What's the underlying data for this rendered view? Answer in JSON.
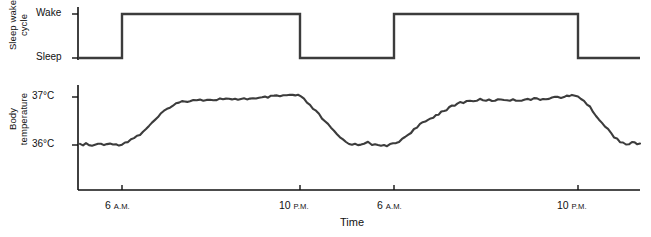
{
  "figure": {
    "width": 651,
    "height": 237,
    "background": "#ffffff",
    "line_color": "#3c3c3c",
    "axis_color": "#111111"
  },
  "panels": {
    "sleep": {
      "axis_title_line1": "Sleep wake",
      "axis_title_line2": "cycle",
      "ticks": [
        {
          "label": "Wake",
          "y": 14
        },
        {
          "label": "Sleep",
          "y": 58
        }
      ]
    },
    "temperature": {
      "axis_title_line1": "Body",
      "axis_title_line2": "temperature",
      "ticks": [
        {
          "label": "37°C",
          "y": 97
        },
        {
          "label": "36°C",
          "y": 145
        }
      ]
    }
  },
  "x_axis": {
    "title": "Time",
    "ticks": [
      {
        "hour": "6",
        "period": "A.M.",
        "x": 122
      },
      {
        "hour": "10",
        "period": "P.M.",
        "x": 300
      },
      {
        "hour": "6",
        "period": "A.M.",
        "x": 394
      },
      {
        "hour": "10",
        "period": "P.M.",
        "x": 578
      }
    ]
  },
  "chart_data": {
    "type": "line",
    "title": "",
    "xlabel": "Time",
    "grid": false,
    "legend": "none",
    "charts": [
      {
        "name": "Sleep wake cycle",
        "type": "line",
        "ylabel": "Sleep wake cycle",
        "ytick_labels": [
          "Wake",
          "Sleep"
        ],
        "ylim": [
          "Sleep",
          "Wake"
        ],
        "description": "Square wave alternating between Sleep and Wake states",
        "series": [
          {
            "name": "sleep-wake state",
            "points": [
              {
                "x": 78,
                "state": "Sleep"
              },
              {
                "x": 122,
                "state": "Sleep"
              },
              {
                "x": 122,
                "state": "Wake"
              },
              {
                "x": 300,
                "state": "Wake"
              },
              {
                "x": 300,
                "state": "Sleep"
              },
              {
                "x": 394,
                "state": "Sleep"
              },
              {
                "x": 394,
                "state": "Wake"
              },
              {
                "x": 578,
                "state": "Wake"
              },
              {
                "x": 578,
                "state": "Sleep"
              },
              {
                "x": 640,
                "state": "Sleep"
              }
            ]
          }
        ]
      },
      {
        "name": "Body temperature",
        "type": "line",
        "ylabel": "Body temperature",
        "ytick_labels": [
          "37°C",
          "36°C"
        ],
        "ylim": [
          35.8,
          37.2
        ],
        "description": "Circadian body temperature rhythm: low during sleep near 36°C, peaking near 37°C during waking hours, across two days",
        "series": [
          {
            "name": "body temperature",
            "units": "°C",
            "values": [
              {
                "x": 80,
                "t": 36.0
              },
              {
                "x": 86,
                "t": 36.02
              },
              {
                "x": 92,
                "t": 35.98
              },
              {
                "x": 98,
                "t": 36.03
              },
              {
                "x": 104,
                "t": 35.99
              },
              {
                "x": 110,
                "t": 36.05
              },
              {
                "x": 116,
                "t": 36.0
              },
              {
                "x": 122,
                "t": 36.02
              },
              {
                "x": 128,
                "t": 36.08
              },
              {
                "x": 134,
                "t": 36.15
              },
              {
                "x": 140,
                "t": 36.22
              },
              {
                "x": 146,
                "t": 36.34
              },
              {
                "x": 152,
                "t": 36.45
              },
              {
                "x": 158,
                "t": 36.58
              },
              {
                "x": 164,
                "t": 36.7
              },
              {
                "x": 170,
                "t": 36.8
              },
              {
                "x": 176,
                "t": 36.86
              },
              {
                "x": 182,
                "t": 36.9
              },
              {
                "x": 190,
                "t": 36.93
              },
              {
                "x": 200,
                "t": 36.95
              },
              {
                "x": 210,
                "t": 36.93
              },
              {
                "x": 220,
                "t": 36.96
              },
              {
                "x": 232,
                "t": 36.94
              },
              {
                "x": 244,
                "t": 36.97
              },
              {
                "x": 256,
                "t": 36.96
              },
              {
                "x": 268,
                "t": 37.0
              },
              {
                "x": 280,
                "t": 37.02
              },
              {
                "x": 290,
                "t": 37.04
              },
              {
                "x": 298,
                "t": 37.03
              },
              {
                "x": 304,
                "t": 36.95
              },
              {
                "x": 310,
                "t": 36.82
              },
              {
                "x": 316,
                "t": 36.7
              },
              {
                "x": 322,
                "t": 36.56
              },
              {
                "x": 328,
                "t": 36.42
              },
              {
                "x": 334,
                "t": 36.28
              },
              {
                "x": 340,
                "t": 36.16
              },
              {
                "x": 346,
                "t": 36.06
              },
              {
                "x": 352,
                "t": 36.02
              },
              {
                "x": 358,
                "t": 36.0
              },
              {
                "x": 364,
                "t": 36.04
              },
              {
                "x": 368,
                "t": 36.08
              },
              {
                "x": 372,
                "t": 36.02
              },
              {
                "x": 378,
                "t": 35.98
              },
              {
                "x": 384,
                "t": 35.99
              },
              {
                "x": 390,
                "t": 36.0
              },
              {
                "x": 396,
                "t": 36.04
              },
              {
                "x": 402,
                "t": 36.12
              },
              {
                "x": 408,
                "t": 36.22
              },
              {
                "x": 414,
                "t": 36.32
              },
              {
                "x": 420,
                "t": 36.42
              },
              {
                "x": 428,
                "t": 36.52
              },
              {
                "x": 436,
                "t": 36.62
              },
              {
                "x": 444,
                "t": 36.72
              },
              {
                "x": 452,
                "t": 36.8
              },
              {
                "x": 460,
                "t": 36.88
              },
              {
                "x": 470,
                "t": 36.92
              },
              {
                "x": 480,
                "t": 36.94
              },
              {
                "x": 492,
                "t": 36.93
              },
              {
                "x": 504,
                "t": 36.95
              },
              {
                "x": 516,
                "t": 36.93
              },
              {
                "x": 528,
                "t": 36.96
              },
              {
                "x": 540,
                "t": 36.95
              },
              {
                "x": 552,
                "t": 36.99
              },
              {
                "x": 564,
                "t": 37.0
              },
              {
                "x": 572,
                "t": 37.03
              },
              {
                "x": 578,
                "t": 37.02
              },
              {
                "x": 584,
                "t": 36.92
              },
              {
                "x": 590,
                "t": 36.78
              },
              {
                "x": 596,
                "t": 36.62
              },
              {
                "x": 602,
                "t": 36.46
              },
              {
                "x": 608,
                "t": 36.32
              },
              {
                "x": 614,
                "t": 36.18
              },
              {
                "x": 620,
                "t": 36.08
              },
              {
                "x": 626,
                "t": 36.02
              },
              {
                "x": 632,
                "t": 36.04
              },
              {
                "x": 640,
                "t": 36.03
              }
            ]
          }
        ]
      }
    ]
  }
}
